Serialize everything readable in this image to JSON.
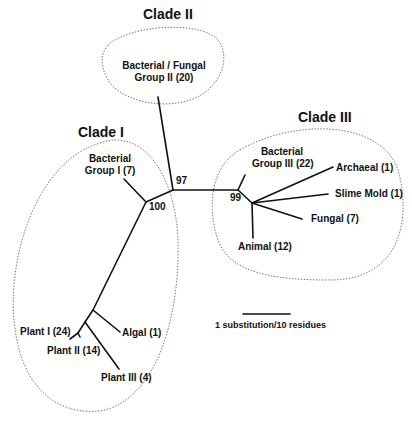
{
  "figure": {
    "type": "unrooted phylogenetic tree",
    "clades": [
      {
        "label": "Clade I",
        "members": [
          "Bacterial Group I (7)",
          "Plant I (24)",
          "Plant II (14)",
          "Plant III (4)",
          "Algal (1)"
        ]
      },
      {
        "label": "Clade II",
        "members": [
          "Bacterial / Fungal Group II (20)"
        ]
      },
      {
        "label": "Clade III",
        "members": [
          "Bacterial Group III (22)",
          "Archaeal (1)",
          "Slime Mold (1)",
          "Fungal (7)",
          "Animal (12)"
        ]
      }
    ],
    "leaves": {
      "bact_fungal_2_line1": "Bacterial / Fungal",
      "bact_fungal_2_line2": "Group II (20)",
      "bact_1_line1": "Bacterial",
      "bact_1_line2": "Group I (7)",
      "bact_3_line1": "Bacterial",
      "bact_3_line2": "Group III (22)",
      "archaeal": "Archaeal (1)",
      "slime_mold": "Slime Mold (1)",
      "fungal": "Fungal (7)",
      "animal": "Animal (12)",
      "plant_1": "Plant I (24)",
      "plant_2": "Plant II (14)",
      "plant_3": "Plant III (4)",
      "algal": "Algal (1)"
    },
    "bootstrap": {
      "n97": "97",
      "n100": "100",
      "n99": "99"
    },
    "scale_bar": "1 substitution/10 residues",
    "clade_labels": {
      "c1": "Clade I",
      "c2": "Clade II",
      "c3": "Clade III"
    }
  }
}
